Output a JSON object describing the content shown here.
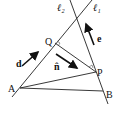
{
  "diagram": {
    "lines": [
      {
        "name": "l1",
        "label": "ℓ₁"
      },
      {
        "name": "l2",
        "label": "ℓ₂"
      }
    ],
    "points": {
      "A": "A",
      "B": "B",
      "P": "P",
      "Q": "Q"
    },
    "vectors": {
      "d": "d",
      "e": "e",
      "n": "n̂"
    },
    "colors": {
      "stroke": "#222222",
      "background": "#ffffff"
    }
  }
}
